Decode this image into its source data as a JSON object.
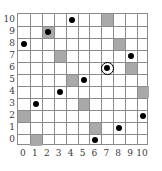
{
  "chart_data": {
    "type": "scatter",
    "title": "",
    "xlabel": "",
    "ylabel": "",
    "xlim": [
      0,
      10
    ],
    "ylim": [
      0,
      10
    ],
    "grid": true,
    "legend": null,
    "x_ticks": [
      "0",
      "1",
      "2",
      "3",
      "4",
      "5",
      "6",
      "7",
      "8",
      "9",
      "10"
    ],
    "y_ticks": [
      "0",
      "1",
      "2",
      "3",
      "4",
      "5",
      "6",
      "7",
      "8",
      "9",
      "10"
    ],
    "points": [
      {
        "x": 4,
        "y": 10,
        "highlighted": false
      },
      {
        "x": 2,
        "y": 9,
        "highlighted": false
      },
      {
        "x": 0,
        "y": 8,
        "highlighted": false
      },
      {
        "x": 9,
        "y": 7,
        "highlighted": false
      },
      {
        "x": 7,
        "y": 6,
        "highlighted": true
      },
      {
        "x": 5,
        "y": 5,
        "highlighted": false
      },
      {
        "x": 3,
        "y": 4,
        "highlighted": false
      },
      {
        "x": 1,
        "y": 3,
        "highlighted": false
      },
      {
        "x": 10,
        "y": 2,
        "highlighted": false
      },
      {
        "x": 8,
        "y": 1,
        "highlighted": false
      },
      {
        "x": 6,
        "y": 0,
        "highlighted": false
      }
    ],
    "shaded_cells": [
      {
        "x": 7,
        "y": 10
      },
      {
        "x": 2,
        "y": 9
      },
      {
        "x": 8,
        "y": 8
      },
      {
        "x": 3,
        "y": 7
      },
      {
        "x": 9,
        "y": 6
      },
      {
        "x": 4,
        "y": 5
      },
      {
        "x": 10,
        "y": 4
      },
      {
        "x": 5,
        "y": 3
      },
      {
        "x": 0,
        "y": 2
      },
      {
        "x": 6,
        "y": 1
      },
      {
        "x": 1,
        "y": 0
      }
    ],
    "colors": {
      "dot": "#000000",
      "shaded_cell": "#a9a9a9",
      "grid_line": "#8a8a8a",
      "background": "#ffffff",
      "tick_label": "#3a3a3a"
    }
  }
}
